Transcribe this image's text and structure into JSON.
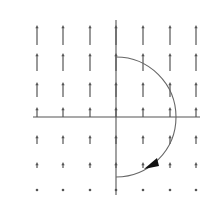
{
  "diagram": {
    "type": "vector-field-with-path",
    "colors": {
      "background": "#ffffff",
      "arrow": "#555555",
      "axis": "#555555",
      "path": "#666666",
      "arrowhead": "#111111"
    },
    "axes": {
      "origin_px": [
        116,
        117
      ],
      "x_axis": {
        "from_px": 33,
        "to_px": 200
      },
      "y_axis": {
        "from_px": 20,
        "to_px": 195
      }
    },
    "grid": {
      "columns_px": [
        37,
        63,
        90,
        116,
        143,
        170,
        196
      ],
      "rows": [
        {
          "base_y_px": 45,
          "length_px": 20
        },
        {
          "base_y_px": 71,
          "length_px": 18
        },
        {
          "base_y_px": 97,
          "length_px": 15
        },
        {
          "base_y_px": 117,
          "length_px": 10
        },
        {
          "base_y_px": 144,
          "length_px": 9
        },
        {
          "base_y_px": 168,
          "length_px": 6
        },
        {
          "base_y_px": 190,
          "length_px": 1
        }
      ],
      "direction": "up"
    },
    "path": {
      "shape": "semicircle",
      "center_px": [
        116,
        117
      ],
      "radius_px": 60,
      "side": "right",
      "orientation": "clockwise (top to bottom)",
      "arrowhead_at_px": [
        153,
        163
      ]
    }
  }
}
